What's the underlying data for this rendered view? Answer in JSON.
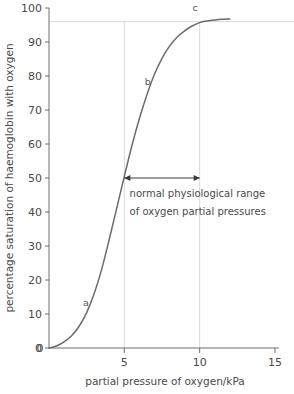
{
  "chart_data": {
    "type": "line",
    "title": "",
    "subtitle": "",
    "xlabel": "partial pressure of oxygen/kPa",
    "ylabel": "percentage saturation of haemoglobin with oxygen",
    "xlim": [
      0,
      15
    ],
    "ylim": [
      0,
      100
    ],
    "x_ticks": [
      0,
      5,
      10,
      15
    ],
    "x_tick_labels": [
      "0",
      "5",
      "10",
      "15"
    ],
    "y_ticks": [
      0,
      10,
      20,
      30,
      40,
      50,
      60,
      70,
      80,
      90,
      100
    ],
    "y_tick_labels": [
      "0",
      "10",
      "20",
      "30",
      "40",
      "50",
      "60",
      "70",
      "80",
      "90",
      "100"
    ],
    "grid": false,
    "legend": "none",
    "series": [
      {
        "name": "oxyhaemoglobin dissociation curve",
        "color": "#6b6b6b",
        "x": [
          0.0,
          0.5,
          1.0,
          1.5,
          2.0,
          2.5,
          3.0,
          3.5,
          4.0,
          4.5,
          5.0,
          5.5,
          6.0,
          6.5,
          7.0,
          7.5,
          8.0,
          8.5,
          9.0,
          9.5,
          10.0,
          10.5,
          11.0,
          11.5,
          12.0
        ],
        "y": [
          0.0,
          0.6,
          1.8,
          3.6,
          6.4,
          10.4,
          16.0,
          23.2,
          32.0,
          41.2,
          50.5,
          59.5,
          67.5,
          74.5,
          80.5,
          85.2,
          88.8,
          91.4,
          93.3,
          94.7,
          95.7,
          96.2,
          96.5,
          96.7,
          96.8
        ]
      }
    ],
    "reference_lines": [
      {
        "name": "saturation-plateau-gridline",
        "orientation": "horizontal",
        "value": 96,
        "color": "#cfcfcf"
      },
      {
        "name": "lower-range-gridline",
        "orientation": "vertical",
        "value": 5,
        "color": "#cfcfcf"
      },
      {
        "name": "upper-range-gridline",
        "orientation": "vertical",
        "value": 10,
        "color": "#cfcfcf"
      }
    ],
    "annotations": [
      {
        "name": "point-a",
        "label": "a",
        "x": 2.45,
        "y": 12.5
      },
      {
        "name": "point-b",
        "label": "b",
        "x": 6.55,
        "y": 77.5
      },
      {
        "name": "point-c",
        "label": "c",
        "x": 9.7,
        "y": 99.0
      },
      {
        "name": "range-arrow",
        "label": "",
        "x_start": 5,
        "x_end": 10,
        "y": 50
      },
      {
        "name": "range-caption-line1",
        "label": "normal physiological range",
        "x": 5.35,
        "y": 44.5
      },
      {
        "name": "range-caption-line2",
        "label": "of oxygen partial pressures",
        "x": 5.35,
        "y": 39.0
      }
    ]
  },
  "colors": {
    "background": "#ffffff",
    "axis": "#6e6e6e",
    "curve": "#6b6b6b",
    "gridline": "#cfcfcf",
    "arrow": "#3a3a3a",
    "text": "#4a4a4a"
  }
}
